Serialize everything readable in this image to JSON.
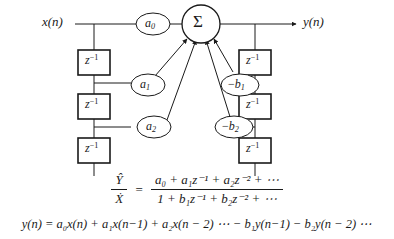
{
  "diagram": {
    "type": "direct-form-I IIR digital filter block diagram",
    "input_label": "x(n)",
    "output_label": "y(n)",
    "summation_symbol": "Σ",
    "delay_label": "z",
    "delay_exponent": "−1",
    "feedforward_delays": 3,
    "feedback_delays": 3,
    "feedforward_coefficients": [
      {
        "id": "a0",
        "base": "a",
        "sub": "0",
        "sign": ""
      },
      {
        "id": "a1",
        "base": "a",
        "sub": "1",
        "sign": ""
      },
      {
        "id": "a2",
        "base": "a",
        "sub": "2",
        "sign": ""
      }
    ],
    "feedback_coefficients": [
      {
        "id": "b1",
        "base": "b",
        "sub": "1",
        "sign": "−"
      },
      {
        "id": "b2",
        "base": "b",
        "sub": "2",
        "sign": "−"
      }
    ],
    "line_color": "#1a1a1a"
  },
  "transfer_function": {
    "lhs_numerator": "Ŷ",
    "lhs_denominator": "Ẋ",
    "equals": "=",
    "rhs_numerator": "a₀ + a₁z⁻¹ + a₂z⁻² + ⋯",
    "rhs_denominator": "1 + b₁z⁻¹ + b₂z⁻² + ⋯"
  },
  "difference_equation": {
    "text": "y(n) = a₀x(n) + a₁x(n−1) + a₂x(n − 2) ⋯ − b₁y(n−1) − b₂y(n − 2) ⋯"
  }
}
